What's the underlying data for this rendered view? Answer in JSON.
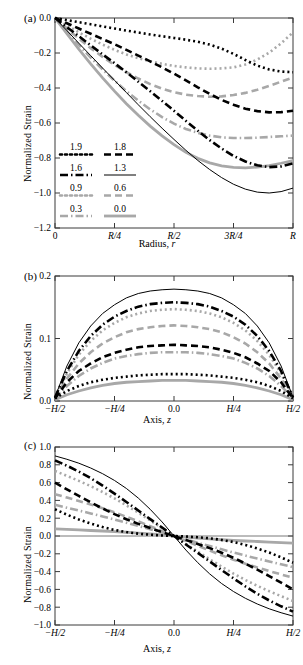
{
  "figure": {
    "panels": [
      {
        "tag": "(a)",
        "id": "a"
      },
      {
        "tag": "(b)",
        "id": "b"
      },
      {
        "tag": "(c)",
        "id": "c"
      }
    ],
    "ylabel": "Normalized Strain"
  },
  "styles": {
    "black": "#000000",
    "gray": "#a8a8a8",
    "axis": "#3a3a3a"
  },
  "legend": {
    "entries": [
      {
        "label": "1.9",
        "color": "#000000",
        "dash": "2,3",
        "width": 2.6,
        "key": "s19"
      },
      {
        "label": "1.8",
        "color": "#000000",
        "dash": "7,4",
        "width": 2.6,
        "key": "s18"
      },
      {
        "label": "1.6",
        "color": "#000000",
        "dash": "8,3,1.5,3",
        "width": 2.6,
        "key": "s16"
      },
      {
        "label": "1.3",
        "color": "#000000",
        "dash": "none",
        "width": 1.0,
        "key": "s13"
      },
      {
        "label": "0.9",
        "color": "#a8a8a8",
        "dash": "2,3",
        "width": 2.6,
        "key": "s09"
      },
      {
        "label": "0.6",
        "color": "#a8a8a8",
        "dash": "7,4",
        "width": 2.6,
        "key": "s06"
      },
      {
        "label": "0.3",
        "color": "#a8a8a8",
        "dash": "8,3,1.5,3",
        "width": 2.6,
        "key": "s03"
      },
      {
        "label": "0.0",
        "color": "#a8a8a8",
        "dash": "none",
        "width": 2.8,
        "key": "s00"
      }
    ]
  },
  "chart_data": [
    {
      "type": "line",
      "panel": "(a)",
      "title": "",
      "xlabel": "Radius, r",
      "ylabel": "Normalized Strain",
      "xlim": [
        0,
        1
      ],
      "ylim": [
        -1.2,
        0.0
      ],
      "xticks": [
        0,
        0.25,
        0.5,
        0.75,
        1.0
      ],
      "xticklabels": [
        "0",
        "R/4",
        "R/2",
        "3R/4",
        "R"
      ],
      "yticks": [
        0.0,
        -0.2,
        -0.4,
        -0.6,
        -0.8,
        -1.0,
        -1.2
      ],
      "yticklabels": [
        "0.0",
        "-0.2",
        "-0.4",
        "-0.6",
        "-0.8",
        "-1.0",
        "-1.2"
      ],
      "grid": false,
      "legend_position": "lower-left",
      "x": [
        0,
        0.05,
        0.1,
        0.15,
        0.2,
        0.25,
        0.3,
        0.35,
        0.4,
        0.45,
        0.5,
        0.55,
        0.6,
        0.65,
        0.7,
        0.75,
        0.8,
        0.85,
        0.9,
        0.95,
        1.0
      ],
      "series": [
        {
          "name": "1.9",
          "key": "s19",
          "values": [
            0.0,
            -0.012,
            -0.024,
            -0.036,
            -0.048,
            -0.06,
            -0.072,
            -0.083,
            -0.094,
            -0.104,
            -0.114,
            -0.124,
            -0.136,
            -0.152,
            -0.175,
            -0.205,
            -0.24,
            -0.272,
            -0.294,
            -0.306,
            -0.31
          ]
        },
        {
          "name": "1.8",
          "key": "s18",
          "values": [
            0.0,
            -0.03,
            -0.06,
            -0.09,
            -0.12,
            -0.15,
            -0.182,
            -0.215,
            -0.248,
            -0.282,
            -0.318,
            -0.356,
            -0.396,
            -0.434,
            -0.468,
            -0.496,
            -0.518,
            -0.532,
            -0.539,
            -0.538,
            -0.53
          ]
        },
        {
          "name": "1.6",
          "key": "s16",
          "values": [
            0.0,
            -0.052,
            -0.104,
            -0.156,
            -0.208,
            -0.258,
            -0.31,
            -0.364,
            -0.418,
            -0.474,
            -0.53,
            -0.588,
            -0.644,
            -0.698,
            -0.746,
            -0.788,
            -0.82,
            -0.842,
            -0.852,
            -0.848,
            -0.83
          ]
        },
        {
          "name": "1.3",
          "key": "s13",
          "values": [
            0.0,
            -0.072,
            -0.144,
            -0.215,
            -0.286,
            -0.356,
            -0.426,
            -0.496,
            -0.564,
            -0.63,
            -0.694,
            -0.756,
            -0.814,
            -0.866,
            -0.912,
            -0.95,
            -0.978,
            -0.995,
            -1.0,
            -0.992,
            -0.972
          ]
        },
        {
          "name": "0.9",
          "key": "s09",
          "values": [
            0.0,
            -0.042,
            -0.082,
            -0.118,
            -0.152,
            -0.182,
            -0.208,
            -0.23,
            -0.248,
            -0.262,
            -0.274,
            -0.282,
            -0.288,
            -0.29,
            -0.288,
            -0.282,
            -0.266,
            -0.238,
            -0.198,
            -0.145,
            -0.082
          ]
        },
        {
          "name": "0.6",
          "key": "s06",
          "values": [
            0.0,
            -0.06,
            -0.118,
            -0.172,
            -0.222,
            -0.268,
            -0.31,
            -0.346,
            -0.378,
            -0.404,
            -0.424,
            -0.438,
            -0.446,
            -0.45,
            -0.448,
            -0.44,
            -0.428,
            -0.41,
            -0.388,
            -0.364,
            -0.34
          ]
        },
        {
          "name": "0.3",
          "key": "s03",
          "values": [
            0.0,
            -0.078,
            -0.154,
            -0.226,
            -0.294,
            -0.358,
            -0.418,
            -0.472,
            -0.522,
            -0.566,
            -0.604,
            -0.634,
            -0.656,
            -0.672,
            -0.682,
            -0.686,
            -0.686,
            -0.684,
            -0.68,
            -0.676,
            -0.672
          ]
        },
        {
          "name": "0.0",
          "key": "s00",
          "values": [
            0.0,
            -0.09,
            -0.178,
            -0.262,
            -0.342,
            -0.418,
            -0.49,
            -0.556,
            -0.618,
            -0.674,
            -0.724,
            -0.768,
            -0.802,
            -0.828,
            -0.845,
            -0.854,
            -0.856,
            -0.852,
            -0.843,
            -0.83,
            -0.815
          ]
        }
      ]
    },
    {
      "type": "line",
      "panel": "(b)",
      "title": "",
      "xlabel": "Axis, z",
      "ylabel": "Normalized Strain",
      "xlim": [
        -0.5,
        0.5
      ],
      "ylim": [
        0.0,
        0.2
      ],
      "xticks": [
        -0.5,
        -0.25,
        0.0,
        0.25,
        0.5
      ],
      "xticklabels": [
        "-H/2",
        "-H/4",
        "0.0",
        "H/4",
        "H/2"
      ],
      "yticks": [
        0.0,
        0.1,
        0.2
      ],
      "yticklabels": [
        "0.0",
        "0.1",
        "0.2"
      ],
      "grid": false,
      "legend_position": "none",
      "x": [
        -0.5,
        -0.45,
        -0.4,
        -0.35,
        -0.3,
        -0.25,
        -0.2,
        -0.15,
        -0.1,
        -0.05,
        0.0,
        0.05,
        0.1,
        0.15,
        0.2,
        0.25,
        0.3,
        0.35,
        0.4,
        0.45,
        0.5
      ],
      "series": [
        {
          "name": "1.9",
          "key": "s19",
          "values": [
            0.004,
            0.016,
            0.024,
            0.03,
            0.034,
            0.037,
            0.039,
            0.041,
            0.042,
            0.043,
            0.043,
            0.043,
            0.042,
            0.041,
            0.039,
            0.037,
            0.034,
            0.03,
            0.024,
            0.016,
            0.004
          ]
        },
        {
          "name": "1.8",
          "key": "s18",
          "values": [
            0.004,
            0.03,
            0.048,
            0.06,
            0.07,
            0.077,
            0.082,
            0.086,
            0.088,
            0.089,
            0.09,
            0.089,
            0.088,
            0.086,
            0.082,
            0.077,
            0.07,
            0.06,
            0.048,
            0.03,
            0.004
          ]
        },
        {
          "name": "1.6",
          "key": "s16",
          "values": [
            0.006,
            0.048,
            0.08,
            0.104,
            0.122,
            0.135,
            0.144,
            0.151,
            0.155,
            0.157,
            0.158,
            0.157,
            0.155,
            0.151,
            0.144,
            0.135,
            0.122,
            0.104,
            0.08,
            0.048,
            0.006
          ]
        },
        {
          "name": "1.3",
          "key": "s13",
          "values": [
            0.006,
            0.056,
            0.093,
            0.12,
            0.14,
            0.154,
            0.165,
            0.172,
            0.176,
            0.178,
            0.179,
            0.178,
            0.176,
            0.172,
            0.165,
            0.154,
            0.14,
            0.12,
            0.093,
            0.056,
            0.006
          ]
        },
        {
          "name": "0.9",
          "key": "s09",
          "values": [
            0.005,
            0.044,
            0.074,
            0.096,
            0.113,
            0.125,
            0.134,
            0.14,
            0.144,
            0.146,
            0.147,
            0.146,
            0.144,
            0.14,
            0.134,
            0.125,
            0.113,
            0.096,
            0.074,
            0.044,
            0.005
          ]
        },
        {
          "name": "0.6",
          "key": "s06",
          "values": [
            0.005,
            0.036,
            0.06,
            0.078,
            0.092,
            0.102,
            0.11,
            0.115,
            0.118,
            0.12,
            0.121,
            0.12,
            0.118,
            0.115,
            0.11,
            0.102,
            0.092,
            0.078,
            0.06,
            0.036,
            0.005
          ]
        },
        {
          "name": "0.3",
          "key": "s03",
          "values": [
            0.004,
            0.024,
            0.04,
            0.052,
            0.061,
            0.068,
            0.072,
            0.075,
            0.077,
            0.078,
            0.078,
            0.078,
            0.077,
            0.075,
            0.072,
            0.068,
            0.061,
            0.052,
            0.04,
            0.024,
            0.004
          ]
        },
        {
          "name": "0.0",
          "key": "s00",
          "values": [
            0.002,
            0.01,
            0.016,
            0.021,
            0.025,
            0.028,
            0.03,
            0.031,
            0.032,
            0.033,
            0.033,
            0.033,
            0.032,
            0.031,
            0.03,
            0.028,
            0.025,
            0.021,
            0.016,
            0.01,
            0.002
          ]
        }
      ]
    },
    {
      "type": "line",
      "panel": "(c)",
      "title": "",
      "xlabel": "Axis, z",
      "ylabel": "Normalized Strain",
      "xlim": [
        -0.5,
        0.5
      ],
      "ylim": [
        -1.0,
        1.0
      ],
      "xticks": [
        -0.5,
        -0.25,
        0.0,
        0.25,
        0.5
      ],
      "xticklabels": [
        "-H/2",
        "-H/4",
        "0.0",
        "H/4",
        "H/2"
      ],
      "yticks": [
        1.0,
        0.8,
        0.6,
        0.4,
        0.2,
        0.0,
        -0.2,
        -0.4,
        -0.6,
        -0.8,
        -1.0
      ],
      "yticklabels": [
        "1.0",
        "0.8",
        "0.6",
        "0.4",
        "0.2",
        "0.0",
        "-0.2",
        "-0.4",
        "-0.6",
        "-0.8",
        "-1.0"
      ],
      "grid": false,
      "legend_position": "none",
      "x": [
        -0.5,
        -0.45,
        -0.4,
        -0.35,
        -0.3,
        -0.25,
        -0.2,
        -0.15,
        -0.1,
        -0.05,
        0.0,
        0.05,
        0.1,
        0.15,
        0.2,
        0.25,
        0.3,
        0.35,
        0.4,
        0.45,
        0.5
      ],
      "series": [
        {
          "name": "1.9",
          "key": "s19",
          "values": [
            0.3,
            0.24,
            0.186,
            0.14,
            0.1,
            0.068,
            0.044,
            0.026,
            0.014,
            0.006,
            0.0,
            -0.006,
            -0.014,
            -0.026,
            -0.044,
            -0.068,
            -0.1,
            -0.14,
            -0.186,
            -0.24,
            -0.3
          ]
        },
        {
          "name": "1.8",
          "key": "s18",
          "values": [
            0.6,
            0.524,
            0.45,
            0.378,
            0.31,
            0.246,
            0.188,
            0.136,
            0.09,
            0.044,
            0.0,
            -0.044,
            -0.09,
            -0.136,
            -0.188,
            -0.246,
            -0.31,
            -0.378,
            -0.45,
            -0.524,
            -0.6
          ]
        },
        {
          "name": "1.6",
          "key": "s16",
          "values": [
            0.85,
            0.79,
            0.724,
            0.65,
            0.566,
            0.476,
            0.382,
            0.286,
            0.19,
            0.095,
            0.0,
            -0.095,
            -0.19,
            -0.286,
            -0.382,
            -0.476,
            -0.566,
            -0.65,
            -0.724,
            -0.79,
            -0.85
          ]
        },
        {
          "name": "1.3",
          "key": "s13",
          "values": [
            0.9,
            0.862,
            0.818,
            0.764,
            0.7,
            0.624,
            0.534,
            0.426,
            0.3,
            0.158,
            0.0,
            -0.158,
            -0.3,
            -0.426,
            -0.534,
            -0.624,
            -0.7,
            -0.764,
            -0.818,
            -0.862,
            -0.9
          ]
        },
        {
          "name": "0.9",
          "key": "s09",
          "values": [
            0.73,
            0.676,
            0.62,
            0.56,
            0.494,
            0.422,
            0.344,
            0.262,
            0.176,
            0.088,
            0.0,
            -0.088,
            -0.176,
            -0.262,
            -0.344,
            -0.422,
            -0.494,
            -0.56,
            -0.62,
            -0.676,
            -0.73
          ]
        },
        {
          "name": "0.6",
          "key": "s06",
          "values": [
            0.47,
            0.432,
            0.394,
            0.354,
            0.312,
            0.266,
            0.216,
            0.164,
            0.11,
            0.055,
            0.0,
            -0.055,
            -0.11,
            -0.164,
            -0.216,
            -0.266,
            -0.312,
            -0.354,
            -0.394,
            -0.432,
            -0.47
          ]
        },
        {
          "name": "0.3",
          "key": "s03",
          "values": [
            0.35,
            0.318,
            0.286,
            0.254,
            0.22,
            0.186,
            0.15,
            0.113,
            0.076,
            0.038,
            0.0,
            -0.038,
            -0.076,
            -0.113,
            -0.15,
            -0.186,
            -0.22,
            -0.254,
            -0.286,
            -0.318,
            -0.35
          ]
        },
        {
          "name": "0.0",
          "key": "s00",
          "values": [
            0.08,
            0.074,
            0.068,
            0.062,
            0.056,
            0.05,
            0.042,
            0.033,
            0.023,
            0.012,
            0.0,
            -0.012,
            -0.023,
            -0.033,
            -0.042,
            -0.05,
            -0.056,
            -0.062,
            -0.068,
            -0.074,
            -0.08
          ]
        }
      ]
    }
  ]
}
